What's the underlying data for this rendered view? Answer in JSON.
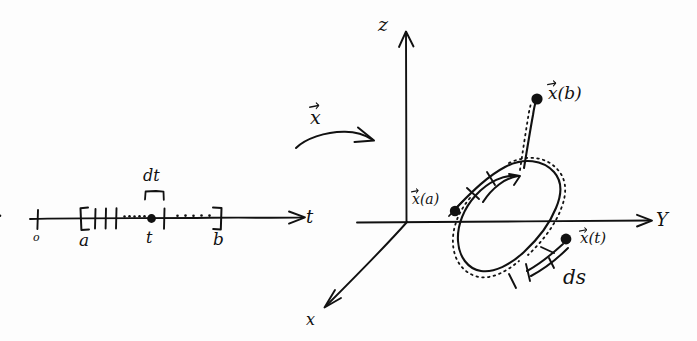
{
  "figure": {
    "ink_color": "#111111",
    "background_color": "#fdfdfd",
    "width": 697,
    "height": 341
  },
  "parameter_axis": {
    "axis_label": "t",
    "origin_label": "o",
    "start_label": "a",
    "interior_point_label": "t",
    "end_label": "b",
    "differential_label": "dt",
    "start_bracket": "[",
    "end_bracket": "]",
    "tick_count": 3,
    "dot_count_left": 5,
    "dot_count_right": 5
  },
  "mapping": {
    "label": "x",
    "accent": "vector-arrow",
    "arrow": "curved-right-arrow"
  },
  "space_axes": {
    "z_label": "z",
    "y_label": "Y",
    "x_label": "x"
  },
  "curve": {
    "start_point_label": "x",
    "start_point_arg": "(a)",
    "end_point_label": "x",
    "end_point_arg": "(b)",
    "current_point_label": "x",
    "current_point_arg": "(t)",
    "arc_element_label": "ds",
    "tick_count": 4,
    "style": "solid curve with dotted companion"
  }
}
